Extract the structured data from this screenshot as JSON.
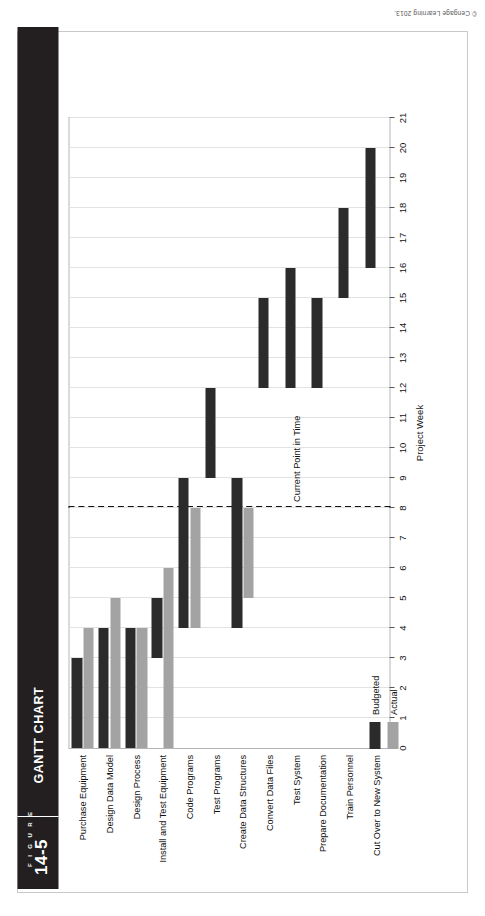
{
  "figure": {
    "figure_word": "F I G U R E",
    "number": "14-5",
    "title": "GANTT CHART"
  },
  "copyright": "© Cengage Learning 2013.",
  "legend": {
    "budgeted_label": "Budgeted",
    "actual_label": "Actual",
    "budgeted_color": "#2b2b2b",
    "actual_color": "#a3a3a3"
  },
  "annotation": {
    "current_point_label": "Current Point in Time",
    "current_point_week": 8
  },
  "chart_data": {
    "type": "bar",
    "title": "Gantt Chart",
    "xlabel": "Project Week",
    "ylabel": "",
    "xlim": [
      0,
      21
    ],
    "xticks": [
      0,
      1,
      2,
      3,
      4,
      5,
      6,
      7,
      8,
      9,
      10,
      11,
      12,
      13,
      14,
      15,
      16,
      17,
      18,
      19,
      20,
      21
    ],
    "grid": true,
    "legend_position": "bottom-left",
    "categories": [
      "Purchase Equipment",
      "Design Data Model",
      "Design Process",
      "Install and Test Equipment",
      "Code Programs",
      "Test Programs",
      "Create Data Structures",
      "Convert Data Files",
      "Test System",
      "Prepare Documentation",
      "Train Personnel",
      "Cut Over to New System"
    ],
    "series": [
      {
        "name": "Budgeted",
        "color": "#2b2b2b",
        "bars": [
          {
            "task": "Purchase Equipment",
            "start": 0,
            "end": 3
          },
          {
            "task": "Design Data Model",
            "start": 0,
            "end": 4
          },
          {
            "task": "Design Process",
            "start": 0,
            "end": 4
          },
          {
            "task": "Install and Test Equipment",
            "start": 3,
            "end": 5
          },
          {
            "task": "Code Programs",
            "start": 4,
            "end": 9
          },
          {
            "task": "Test Programs",
            "start": 9,
            "end": 12
          },
          {
            "task": "Create Data Structures",
            "start": 4,
            "end": 9
          },
          {
            "task": "Convert Data Files",
            "start": 12,
            "end": 15
          },
          {
            "task": "Test System",
            "start": 12,
            "end": 16
          },
          {
            "task": "Prepare Documentation",
            "start": 12,
            "end": 15
          },
          {
            "task": "Train Personnel",
            "start": 15,
            "end": 18
          },
          {
            "task": "Cut Over to New System",
            "start": 16,
            "end": 20
          }
        ]
      },
      {
        "name": "Actual",
        "color": "#a3a3a3",
        "bars": [
          {
            "task": "Purchase Equipment",
            "start": 0,
            "end": 4
          },
          {
            "task": "Design Data Model",
            "start": 0,
            "end": 5
          },
          {
            "task": "Design Process",
            "start": 0,
            "end": 4
          },
          {
            "task": "Install and Test Equipment",
            "start": 0,
            "end": 6
          },
          {
            "task": "Code Programs",
            "start": 4,
            "end": 8
          },
          {
            "task": "Create Data Structures",
            "start": 5,
            "end": 8
          }
        ]
      }
    ]
  }
}
